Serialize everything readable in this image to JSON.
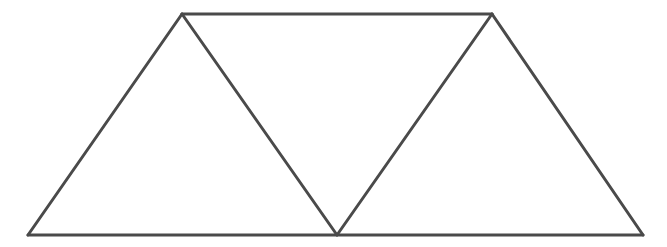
{
  "diagram": {
    "stroke_color": "#4a4a4a",
    "stroke_width": 3,
    "background": "#ffffff",
    "vertices": {
      "top_left": [
        182,
        14
      ],
      "top_right": [
        492,
        14
      ],
      "bottom_left": [
        28,
        235
      ],
      "bottom_middle": [
        337,
        235
      ],
      "bottom_right": [
        643,
        235
      ]
    },
    "segments": [
      {
        "name": "top-edge",
        "from": "top_left",
        "to": "top_right"
      },
      {
        "name": "bottom-edge",
        "from": "bottom_left",
        "to": "bottom_right"
      },
      {
        "name": "left-edge",
        "from": "bottom_left",
        "to": "top_left"
      },
      {
        "name": "diagonal-1",
        "from": "top_left",
        "to": "bottom_middle"
      },
      {
        "name": "diagonal-2",
        "from": "bottom_middle",
        "to": "top_right"
      },
      {
        "name": "right-edge",
        "from": "top_right",
        "to": "bottom_right"
      }
    ],
    "triangles": [
      {
        "name": "left-triangle",
        "points": [
          "bottom_left",
          "top_left",
          "bottom_middle"
        ]
      },
      {
        "name": "middle-triangle",
        "points": [
          "top_left",
          "top_right",
          "bottom_middle"
        ]
      },
      {
        "name": "right-triangle",
        "points": [
          "bottom_middle",
          "top_right",
          "bottom_right"
        ]
      }
    ]
  }
}
